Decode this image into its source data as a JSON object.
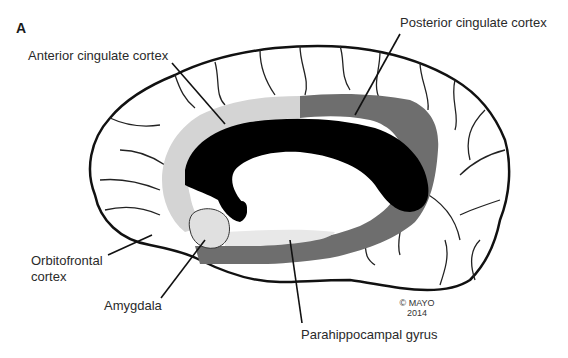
{
  "figure": {
    "panel_letter": "A",
    "copyright_line1": "© MAYO",
    "copyright_line2": "2014"
  },
  "labels": {
    "anterior_cingulate": "Anterior cingulate cortex",
    "posterior_cingulate": "Posterior cingulate cortex",
    "orbitofrontal_line1": "Orbitofrontal",
    "orbitofrontal_line2": "cortex",
    "amygdala": "Amygdala",
    "parahippocampal": "Parahippocampal gyrus"
  },
  "colors": {
    "outline": "#111111",
    "corpus_callosum": "#000000",
    "anterior_region": "#d4d4d4",
    "posterior_region": "#6e6e6e",
    "amygdala_region": "#e0e0e0",
    "background": "#ffffff"
  }
}
